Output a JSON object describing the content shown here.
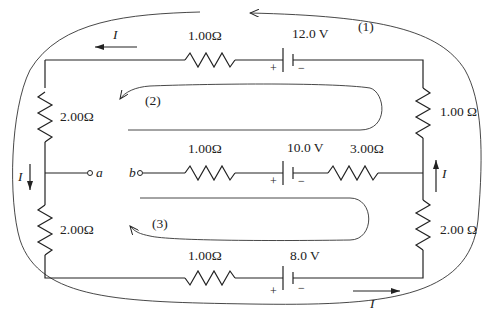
{
  "diagram": {
    "type": "circuit",
    "top_branch": {
      "resistor": "1.00Ω",
      "battery": "12.0 V",
      "plus": "+",
      "minus": "−",
      "current": "I"
    },
    "left_upper_resistor": "2.00Ω",
    "left_lower_resistor": "2.00Ω",
    "right_upper_resistor": "1.00 Ω",
    "right_lower_resistor": "2.00 Ω",
    "middle_branch": {
      "resistor1": "1.00Ω",
      "battery": "10.0 V",
      "resistor2": "3.00Ω",
      "plus": "+",
      "minus": "−",
      "terminal_a": "a",
      "terminal_b": "b"
    },
    "bottom_branch": {
      "resistor": "1.00Ω",
      "battery": "8.0 V",
      "plus": "+",
      "minus": "−",
      "current": "I"
    },
    "left_current": "I",
    "right_current": "I",
    "loops": [
      "(1)",
      "(2)",
      "(3)"
    ]
  }
}
